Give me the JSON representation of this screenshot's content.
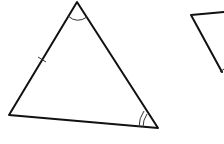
{
  "figure": {
    "stroke_color": "#111111",
    "background": "#ffffff",
    "triangle_1": {
      "vertices": {
        "top": [
          77,
          2
        ],
        "left": [
          9,
          115
        ],
        "right": [
          158,
          128
        ]
      },
      "markings": {
        "top_angle": "single arc",
        "right_angle": "double arc",
        "left_side": "single tick"
      }
    },
    "triangle_2_partial": {
      "vertices_visible": {
        "top_left": [
          191,
          15
        ],
        "top_right_edge": [
          224,
          12
        ],
        "bottom_right_edge": [
          222,
          72
        ]
      },
      "markings": {
        "right_side_lower": "single tick (partially visible)"
      }
    }
  }
}
